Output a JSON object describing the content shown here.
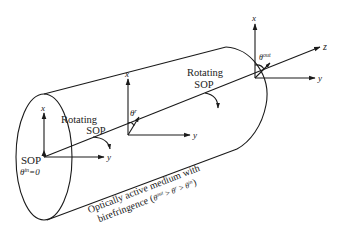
{
  "diagram": {
    "type": "optical-rotation-cylinder",
    "colors": {
      "stroke": "#1a1a1a",
      "text": "#222222",
      "background": "#ffffff"
    },
    "left_frame": {
      "x_label": "x",
      "y_label": "y",
      "sop_label": "SOP",
      "theta_label": "θ",
      "theta_sup": "in",
      "theta_value": "=0"
    },
    "middle_frame": {
      "x_label": "x",
      "y_label": "y",
      "theta_label": "θ",
      "theta_sup": "r",
      "rotating_line1": "Rotating",
      "rotating_line2": "SOP"
    },
    "right_frame": {
      "x_label": "x",
      "y_label": "y",
      "z_label": "z",
      "theta_label": "θ",
      "theta_sup": "out",
      "rotating_line1": "Rotating",
      "rotating_line2": "SOP"
    },
    "medium_caption": {
      "line1": "Optically active medium with",
      "line2_prefix": "birefringence (",
      "t1": "θ",
      "t1_sup": "out",
      "gt1": " > ",
      "t2": "θ",
      "t2_sup": "r",
      "gt2": " > ",
      "t3": "θ",
      "t3_sup": "in",
      "close": ")"
    }
  }
}
